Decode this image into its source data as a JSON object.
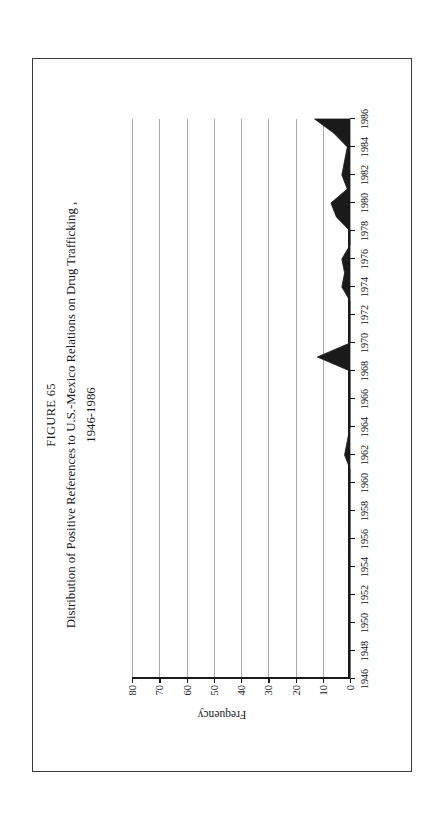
{
  "page": {
    "border_color": "#3a3a3a",
    "background": "#ffffff"
  },
  "figure": {
    "number_label": "FIGURE 65",
    "title": "Distribution of Positive References to U.S.-Mexico Relations on Drug Trafficking ,",
    "subtitle": "1946-1986",
    "orientation_note": "rotated"
  },
  "chart_data": {
    "type": "area",
    "title": "Distribution of Positive References to U.S.-Mexico Relations on Drug Trafficking , 1946-1986",
    "xlabel": "",
    "ylabel": "Frequency",
    "ylim": [
      0,
      80
    ],
    "yticks": [
      0,
      10,
      20,
      30,
      40,
      50,
      60,
      70,
      80
    ],
    "ytick_labels": [
      "0",
      "10",
      "20",
      "30",
      "40",
      "50",
      "60",
      "70",
      "80"
    ],
    "xlim": [
      1946,
      1986
    ],
    "xticks": [
      1946,
      1948,
      1950,
      1952,
      1954,
      1956,
      1958,
      1960,
      1962,
      1964,
      1966,
      1968,
      1970,
      1972,
      1974,
      1976,
      1978,
      1980,
      1982,
      1984,
      1986
    ],
    "xtick_labels": [
      "1946",
      "1948",
      "1950",
      "1952",
      "1954",
      "1956",
      "1958",
      "1960",
      "1962",
      "1964",
      "1966",
      "1968",
      "1970",
      "1972",
      "1974",
      "1976",
      "1978",
      "1980",
      "1982",
      "1984",
      "1986"
    ],
    "grid": true,
    "grid_axis": "y",
    "grid_color": "#a9a9a9",
    "fill_color": "#1a1a1a",
    "legend": null,
    "x": [
      1946,
      1947,
      1948,
      1949,
      1950,
      1951,
      1952,
      1953,
      1954,
      1955,
      1956,
      1957,
      1958,
      1959,
      1960,
      1961,
      1962,
      1963,
      1964,
      1965,
      1966,
      1967,
      1968,
      1969,
      1970,
      1971,
      1972,
      1973,
      1974,
      1975,
      1976,
      1977,
      1978,
      1979,
      1980,
      1981,
      1982,
      1983,
      1984,
      1985,
      1986
    ],
    "values": [
      0,
      0,
      0,
      0,
      0,
      0,
      0,
      0,
      0,
      0,
      0,
      0,
      0,
      0,
      0,
      0,
      2,
      1,
      0,
      0,
      0,
      0,
      0,
      12,
      0,
      0,
      0,
      0,
      3,
      2,
      3,
      0,
      0,
      5,
      7,
      1,
      3,
      2,
      1,
      6,
      13
    ],
    "series": [
      {
        "name": "Positive references",
        "values": [
          0,
          0,
          0,
          0,
          0,
          0,
          0,
          0,
          0,
          0,
          0,
          0,
          0,
          0,
          0,
          0,
          2,
          1,
          0,
          0,
          0,
          0,
          0,
          12,
          0,
          0,
          0,
          0,
          3,
          2,
          3,
          0,
          0,
          5,
          7,
          1,
          3,
          2,
          1,
          6,
          13
        ]
      }
    ]
  }
}
